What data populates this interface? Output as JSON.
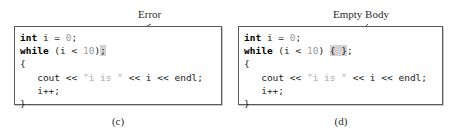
{
  "figure": {
    "panels": [
      {
        "id": "c",
        "caption": "(c)",
        "annotation": {
          "label": "Error",
          "icon": "arrow-icon"
        },
        "code": {
          "lines": [
            {
              "tokens": [
                {
                  "text": "int",
                  "style": "kw"
                },
                {
                  "text": " i = ",
                  "style": "plain"
                },
                {
                  "text": "0",
                  "style": "lit"
                },
                {
                  "text": ";",
                  "style": "plain"
                }
              ]
            },
            {
              "tokens": [
                {
                  "text": "while",
                  "style": "kw"
                },
                {
                  "text": " (i < ",
                  "style": "plain"
                },
                {
                  "text": "10",
                  "style": "lit"
                },
                {
                  "text": ")",
                  "style": "plain"
                },
                {
                  "text": ";",
                  "style": "highlight"
                }
              ]
            },
            {
              "tokens": [
                {
                  "text": "{",
                  "style": "plain"
                }
              ]
            },
            {
              "tokens": [
                {
                  "text": "   cout << ",
                  "style": "plain"
                },
                {
                  "text": "\"i is \"",
                  "style": "str"
                },
                {
                  "text": " << i << endl;",
                  "style": "plain"
                }
              ]
            },
            {
              "tokens": [
                {
                  "text": "   i++;",
                  "style": "plain"
                }
              ]
            },
            {
              "tokens": [
                {
                  "text": "}",
                  "style": "plain"
                }
              ]
            }
          ]
        }
      },
      {
        "id": "d",
        "caption": "(d)",
        "annotation": {
          "label": "Empty Body",
          "icon": "arrow-icon"
        },
        "code": {
          "lines": [
            {
              "tokens": [
                {
                  "text": "int",
                  "style": "kw"
                },
                {
                  "text": " i = ",
                  "style": "plain"
                },
                {
                  "text": "0",
                  "style": "lit"
                },
                {
                  "text": ";",
                  "style": "plain"
                }
              ]
            },
            {
              "tokens": [
                {
                  "text": "while",
                  "style": "kw"
                },
                {
                  "text": " (i < ",
                  "style": "plain"
                },
                {
                  "text": "10",
                  "style": "lit"
                },
                {
                  "text": ") ",
                  "style": "plain"
                },
                {
                  "text": "{ }",
                  "style": "highlight"
                },
                {
                  "text": ";",
                  "style": "plain"
                }
              ]
            },
            {
              "tokens": [
                {
                  "text": "{",
                  "style": "plain"
                }
              ]
            },
            {
              "tokens": [
                {
                  "text": "   cout << ",
                  "style": "plain"
                },
                {
                  "text": "\"i is \"",
                  "style": "str"
                },
                {
                  "text": " << i << endl;",
                  "style": "plain"
                }
              ]
            },
            {
              "tokens": [
                {
                  "text": "   i++;",
                  "style": "plain"
                }
              ]
            },
            {
              "tokens": [
                {
                  "text": "}",
                  "style": "plain"
                }
              ]
            }
          ]
        }
      }
    ],
    "colors": {
      "box_border": "#5a5a5a",
      "text": "#1b1b1b",
      "literal": "#9a9a9a",
      "string": "#a8a8a8",
      "highlight": "#d2d2d2",
      "label": "#2b2b2b"
    }
  }
}
